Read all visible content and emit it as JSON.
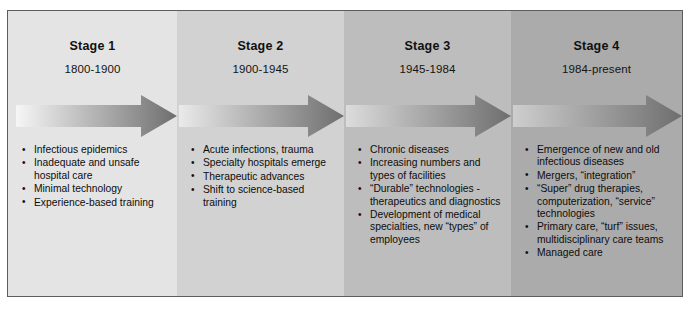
{
  "figure": {
    "frame_color": "#5d5d5d"
  },
  "bands": [
    {
      "name": "band-stage-1",
      "color": "#e4e4e4"
    },
    {
      "name": "band-stage-2",
      "color": "#d2d2d2"
    },
    {
      "name": "band-stage-3",
      "color": "#bdbdbd"
    },
    {
      "name": "band-stage-4",
      "color": "#ababab"
    }
  ],
  "arrow": {
    "name": "progression-arrow",
    "gradient_start": "#f2f2f2",
    "gradient_end": "#6e6e6e"
  },
  "stages": [
    {
      "title": "Stage 1",
      "dates": "1800-1900",
      "bullets": [
        "Infectious epidemics",
        "Inadequate and unsafe hospital care",
        "Minimal technology",
        "Experience-based training"
      ]
    },
    {
      "title": "Stage 2",
      "dates": "1900-1945",
      "bullets": [
        "Acute infections, trauma",
        "Specialty hospitals emerge",
        "Therapeutic advances",
        "Shift to science-based training"
      ]
    },
    {
      "title": "Stage 3",
      "dates": "1945-1984",
      "bullets": [
        "Chronic diseases",
        "Increasing numbers and types of facilities",
        "“Durable” technologies - therapeutics and diagnostics",
        "Development of medical specialties, new “types” of employees"
      ]
    },
    {
      "title": "Stage 4",
      "dates": "1984-present",
      "bullets": [
        "Emergence of new and old infectious diseases",
        "Mergers, “integration”",
        "“Super” drug therapies, computerization, “service” technologies",
        "Primary care, “turf” issues, multidisciplinary care teams",
        "Managed care"
      ]
    }
  ]
}
